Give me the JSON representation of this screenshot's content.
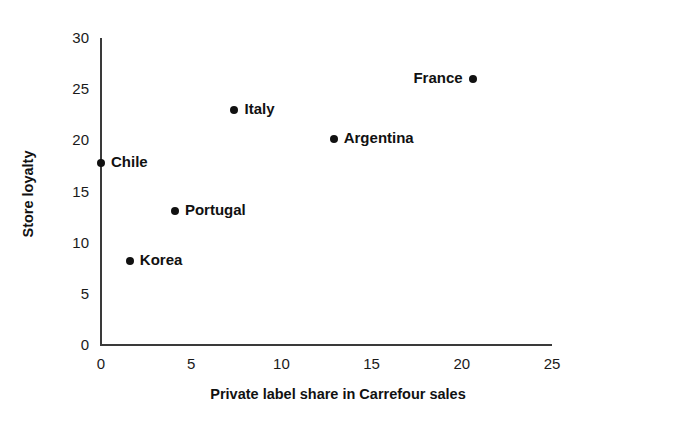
{
  "chart_data": {
    "type": "scatter",
    "title": "",
    "xlabel": "Private label share in Carrefour sales",
    "ylabel": "Store loyalty",
    "xlim": [
      0,
      25
    ],
    "ylim": [
      0,
      30
    ],
    "xticks": [
      "0",
      "5",
      "10",
      "15",
      "20",
      "25"
    ],
    "yticks": [
      "0",
      "5",
      "10",
      "15",
      "20",
      "25",
      "30"
    ],
    "grid": false,
    "legend": "none",
    "marker_color": "#111111",
    "axis_color": "#3a3a3a",
    "points": [
      {
        "label": "Chile",
        "x": 0.0,
        "y": 17.8,
        "label_side": "right"
      },
      {
        "label": "Korea",
        "x": 1.6,
        "y": 8.2,
        "label_side": "right"
      },
      {
        "label": "Portugal",
        "x": 4.1,
        "y": 13.1,
        "label_side": "right"
      },
      {
        "label": "Italy",
        "x": 7.4,
        "y": 23.0,
        "label_side": "right"
      },
      {
        "label": "Argentina",
        "x": 12.9,
        "y": 20.1,
        "label_side": "right"
      },
      {
        "label": "France",
        "x": 20.6,
        "y": 26.0,
        "label_side": "left"
      }
    ]
  }
}
